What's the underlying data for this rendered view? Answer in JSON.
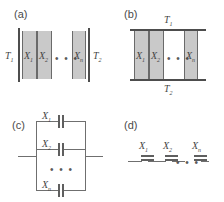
{
  "figure": {
    "panels": [
      {
        "id": "a",
        "letter": "(a)",
        "type": "slab-stack-horizontal",
        "left_temperature": "T",
        "left_temperature_sub": "1",
        "right_temperature": "T",
        "right_temperature_sub": "2",
        "elements": [
          "X",
          "X",
          "X"
        ],
        "element_subs": [
          "1",
          "2",
          "n"
        ],
        "ellipsis": "• • •"
      },
      {
        "id": "b",
        "letter": "(b)",
        "type": "slab-stack-vertical-bars",
        "top_temperature": "T",
        "top_temperature_sub": "1",
        "bottom_temperature": "T",
        "bottom_temperature_sub": "2",
        "elements": [
          "X",
          "X",
          "X"
        ],
        "element_subs": [
          "1",
          "2",
          "n"
        ],
        "ellipsis": "• • •"
      },
      {
        "id": "c",
        "letter": "(c)",
        "type": "capacitors-parallel",
        "elements": [
          "X",
          "X",
          "X"
        ],
        "element_subs": [
          "1",
          "2",
          "n"
        ],
        "ellipsis": "• • •"
      },
      {
        "id": "d",
        "letter": "(d)",
        "type": "capacitors-series",
        "elements": [
          "X",
          "X",
          "X"
        ],
        "element_subs": [
          "1",
          "2",
          "n"
        ],
        "ellipsis": "• • •"
      }
    ]
  },
  "colors": {
    "slab_fill": "#c9c9c9",
    "bar": "#4d4d4d",
    "wire": "#6f6f6f",
    "text": "#454545",
    "background": "#ffffff"
  }
}
